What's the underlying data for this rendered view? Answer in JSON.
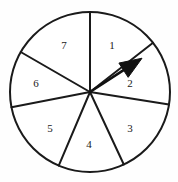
{
  "figure": {
    "name": "spinner-wheel",
    "type": "probability-spinner",
    "background_color": "#fefefe",
    "stroke_color": "#1a1a1a",
    "fill_color": "#ffffff"
  },
  "wheel": {
    "center_x": 90,
    "center_y": 92,
    "radius": 80,
    "stroke_width": 2,
    "sector_count": 7
  },
  "sectors": [
    {
      "label": "1",
      "label_x": 112,
      "label_y": 45,
      "start_angle": 0,
      "end_angle": 52
    },
    {
      "label": "2",
      "label_x": 130,
      "label_y": 83,
      "start_angle": 52,
      "end_angle": 99
    },
    {
      "label": "3",
      "label_x": 130,
      "label_y": 128,
      "start_angle": 99,
      "end_angle": 155
    },
    {
      "label": "4",
      "label_x": 89,
      "label_y": 144,
      "start_angle": 155,
      "end_angle": 203
    },
    {
      "label": "5",
      "label_x": 50,
      "label_y": 128,
      "start_angle": 203,
      "end_angle": 259
    },
    {
      "label": "6",
      "label_x": 36,
      "label_y": 83,
      "start_angle": 259,
      "end_angle": 300
    },
    {
      "label": "7",
      "label_x": 64,
      "label_y": 45,
      "start_angle": 300,
      "end_angle": 360
    }
  ],
  "pointer": {
    "name": "spinner-arrow",
    "angle_deg": 57,
    "length": 62,
    "shaft_width": 2.6,
    "head_length": 22,
    "head_width": 17,
    "color": "#111111"
  }
}
